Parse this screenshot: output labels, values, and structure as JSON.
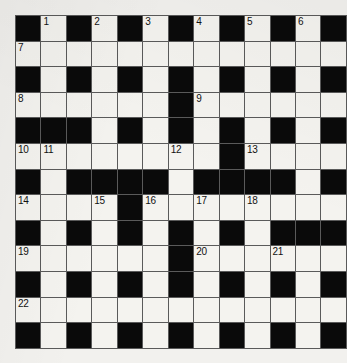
{
  "puzzle": {
    "kind": "crossword-grid",
    "columns": 13,
    "rows": 13,
    "colors": {
      "paper": "#f2f1ee",
      "open_cell": "#f4f3ef",
      "block_cell": "#0a0a0a",
      "grid_line": "#5a5a5a",
      "number_text": "#111111"
    },
    "highest_clue_number": 22,
    "clue_numbers": [
      1,
      2,
      3,
      4,
      5,
      6,
      7,
      8,
      9,
      10,
      11,
      12,
      13,
      14,
      15,
      16,
      17,
      18,
      19,
      20,
      21,
      22
    ],
    "legend": {
      "1": "block",
      "0": "open"
    },
    "grid": [
      [
        1,
        0,
        1,
        0,
        1,
        0,
        1,
        0,
        1,
        0,
        1,
        0,
        1
      ],
      [
        0,
        0,
        0,
        0,
        0,
        0,
        0,
        0,
        0,
        0,
        0,
        0,
        0
      ],
      [
        1,
        0,
        1,
        0,
        1,
        0,
        1,
        0,
        1,
        0,
        1,
        0,
        1
      ],
      [
        0,
        0,
        0,
        0,
        0,
        0,
        1,
        0,
        0,
        0,
        0,
        0,
        0
      ],
      [
        1,
        1,
        1,
        0,
        1,
        0,
        1,
        0,
        1,
        0,
        1,
        0,
        1
      ],
      [
        0,
        0,
        0,
        0,
        0,
        0,
        0,
        0,
        1,
        0,
        0,
        0,
        0
      ],
      [
        1,
        0,
        1,
        1,
        1,
        1,
        0,
        1,
        1,
        1,
        1,
        0,
        1
      ],
      [
        0,
        0,
        0,
        0,
        1,
        0,
        0,
        0,
        0,
        0,
        0,
        0,
        0
      ],
      [
        1,
        0,
        1,
        0,
        1,
        0,
        1,
        0,
        1,
        0,
        1,
        1,
        1
      ],
      [
        0,
        0,
        0,
        0,
        0,
        0,
        1,
        0,
        0,
        0,
        0,
        0,
        0
      ],
      [
        1,
        0,
        1,
        0,
        1,
        0,
        1,
        0,
        1,
        0,
        1,
        0,
        1
      ],
      [
        0,
        0,
        0,
        0,
        0,
        0,
        0,
        0,
        0,
        0,
        0,
        0,
        0
      ],
      [
        1,
        0,
        1,
        0,
        1,
        0,
        1,
        0,
        1,
        0,
        1,
        0,
        1
      ]
    ],
    "numbers": [
      {
        "row": 0,
        "col": 1,
        "label": "1"
      },
      {
        "row": 0,
        "col": 3,
        "label": "2"
      },
      {
        "row": 0,
        "col": 5,
        "label": "3"
      },
      {
        "row": 0,
        "col": 7,
        "label": "4"
      },
      {
        "row": 0,
        "col": 9,
        "label": "5"
      },
      {
        "row": 0,
        "col": 11,
        "label": "6"
      },
      {
        "row": 1,
        "col": 0,
        "label": "7"
      },
      {
        "row": 3,
        "col": 0,
        "label": "8"
      },
      {
        "row": 3,
        "col": 7,
        "label": "9"
      },
      {
        "row": 5,
        "col": 0,
        "label": "10"
      },
      {
        "row": 5,
        "col": 1,
        "label": "11"
      },
      {
        "row": 5,
        "col": 6,
        "label": "12"
      },
      {
        "row": 5,
        "col": 9,
        "label": "13"
      },
      {
        "row": 7,
        "col": 0,
        "label": "14"
      },
      {
        "row": 7,
        "col": 3,
        "label": "15"
      },
      {
        "row": 7,
        "col": 5,
        "label": "16"
      },
      {
        "row": 7,
        "col": 7,
        "label": "17"
      },
      {
        "row": 7,
        "col": 9,
        "label": "18"
      },
      {
        "row": 9,
        "col": 0,
        "label": "19"
      },
      {
        "row": 9,
        "col": 7,
        "label": "20"
      },
      {
        "row": 9,
        "col": 10,
        "label": "21"
      },
      {
        "row": 11,
        "col": 0,
        "label": "22"
      }
    ]
  }
}
